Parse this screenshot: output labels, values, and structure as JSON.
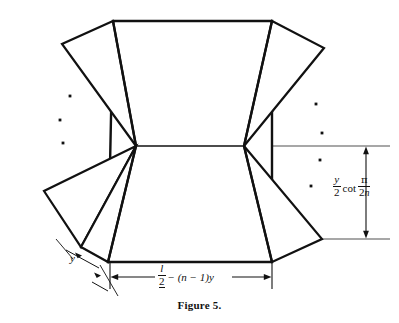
{
  "figure": {
    "caption": "Figure 5.",
    "colors": {
      "stroke": "#111111",
      "guide_line": "#8a8a8a",
      "dimension_line": "#111111",
      "background": "#ffffff"
    }
  },
  "labels": {
    "height_dimension": {
      "name": "y-over-2-cot-pi-over-2n",
      "numerator": "y",
      "denominator": "2",
      "operator": "cot",
      "arg_numerator": "π",
      "arg_denominator_coefficient": "2",
      "arg_denominator_variable": "n",
      "plain_text": "y/2 cot π/2n"
    },
    "width_dimension": {
      "name": "half-l-minus-n-minus-1-y",
      "numerator": "l",
      "denominator": "2",
      "expression_rest": "− (n − 1)y",
      "plain_text": "l/2 − (n − 1)y"
    },
    "edge_dimension": {
      "name": "y",
      "text": "y"
    }
  },
  "geometry": {
    "central_quad": [
      [
        113,
        21
      ],
      [
        272,
        21
      ],
      [
        272,
        262
      ],
      [
        108,
        262
      ]
    ],
    "hub_upper_left": [
      136,
      146
    ],
    "hub_upper_right": [
      244,
      146
    ],
    "upper_left_flap": [
      [
        113,
        21
      ],
      [
        62,
        44
      ],
      [
        136,
        146
      ]
    ],
    "upper_right_flap": [
      [
        272,
        21
      ],
      [
        324,
        48
      ],
      [
        244,
        146
      ]
    ],
    "lower_left_flaps": [
      [
        [
          136,
          146
        ],
        [
          44,
          191
        ],
        [
          81,
          247
        ]
      ],
      [
        [
          136,
          146
        ],
        [
          81,
          247
        ],
        [
          108,
          262
        ]
      ]
    ],
    "lower_right_flap": [
      [
        244,
        146
      ],
      [
        322,
        239
      ],
      [
        272,
        262
      ]
    ],
    "ellipsis_left": [
      [
        70,
        96
      ],
      [
        60,
        120
      ],
      [
        63,
        143
      ]
    ],
    "ellipsis_right": [
      [
        316,
        104
      ],
      [
        322,
        133
      ],
      [
        320,
        160
      ],
      [
        311,
        186
      ]
    ]
  }
}
